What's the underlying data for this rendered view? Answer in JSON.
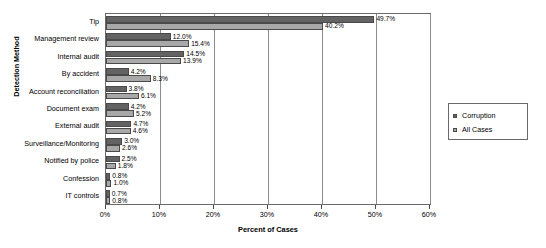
{
  "chart_data": {
    "type": "bar",
    "orientation": "horizontal",
    "title": "",
    "xlabel": "Percent of Cases",
    "ylabel": "Detection Method",
    "xlim": [
      0,
      60
    ],
    "xticks": [
      "0%",
      "10%",
      "20%",
      "30%",
      "40%",
      "50%",
      "60%"
    ],
    "xtick_values": [
      0,
      10,
      20,
      30,
      40,
      50,
      60
    ],
    "grid": true,
    "legend_position": "right",
    "categories": [
      "Tip",
      "Management review",
      "Internal audit",
      "By accident",
      "Account reconciliation",
      "Document exam",
      "External audit",
      "Surveillance/Monitoring",
      "Notified by police",
      "Confession",
      "IT controls"
    ],
    "series": [
      {
        "name": "Corruption",
        "color": "#636363",
        "values": [
          49.7,
          12.0,
          14.5,
          4.2,
          3.8,
          4.2,
          4.7,
          3.0,
          2.5,
          0.8,
          0.7
        ],
        "labels": [
          "49.7%",
          "12.0%",
          "14.5%",
          "4.2%",
          "3.8%",
          "4.2%",
          "4.7%",
          "3.0%",
          "2.5%",
          "0.8%",
          "0.7%"
        ]
      },
      {
        "name": "All Cases",
        "color": "#a8a8a8",
        "values": [
          40.2,
          15.4,
          13.9,
          8.3,
          6.1,
          5.2,
          4.6,
          2.6,
          1.8,
          1.0,
          0.8
        ],
        "labels": [
          "40.2%",
          "15.4%",
          "13.9%",
          "8.3%",
          "6.1%",
          "5.2%",
          "4.6%",
          "2.6%",
          "1.8%",
          "1.0%",
          "0.8%"
        ]
      }
    ]
  },
  "legend": {
    "items": [
      {
        "label": "Corruption"
      },
      {
        "label": "All Cases"
      }
    ]
  }
}
